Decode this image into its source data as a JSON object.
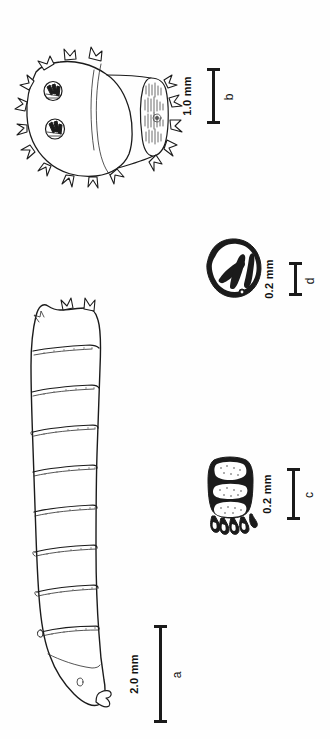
{
  "figure": {
    "background_color": "#ffffff",
    "ink_color": "#1b1b1b",
    "orientation_note": "plate rotated 90 degrees; labels read bottom-to-top",
    "panels": [
      {
        "id": "a",
        "letter": "a",
        "subject": "whole larva, lateral view, segmented body with spinule bands",
        "scale_value": "2.0 mm",
        "segment_count": 9
      },
      {
        "id": "b",
        "letter": "b",
        "subject": "posterior segment with pair of spiracular plates and marginal tubercles",
        "scale_value": "1.0 mm",
        "spiracle_count": 2
      },
      {
        "id": "c",
        "letter": "c",
        "subject": "cephalopharyngeal skeleton segment with ventral hooks",
        "scale_value": "0.2 mm",
        "hook_count": 7
      },
      {
        "id": "d",
        "letter": "d",
        "subject": "spiracular plate with three sinuous slits",
        "scale_value": "0.2 mm",
        "slit_count": 3
      }
    ]
  },
  "scalebars": {
    "b": {
      "label": "1.0 mm",
      "panel": "b"
    },
    "d": {
      "label": "0.2 mm",
      "panel": "d"
    },
    "c": {
      "label": "0.2 mm",
      "panel": "c"
    },
    "a": {
      "label": "2.0 mm",
      "panel": "a"
    }
  }
}
